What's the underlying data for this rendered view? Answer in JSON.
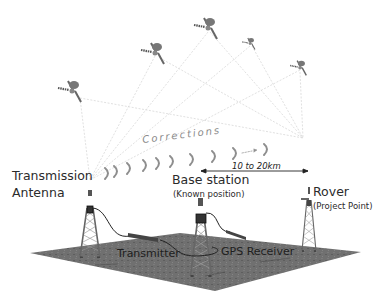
{
  "labels": {
    "transmission_antenna_line1": "Transmission",
    "transmission_antenna_line2": "Antenna",
    "corrections": "Corrections",
    "distance": "10 to 20km",
    "base_station": "Base station",
    "base_station_sub": "(Known position)",
    "rover": "Rover",
    "rover_sub": "(Project  Point)",
    "transmitter": "Transmitter",
    "gps_receiver": "GPS Receiver"
  },
  "colors": {
    "ground": "#6f6f6f",
    "text": "#2b2b2b",
    "signal_lines": "#cfcfcf",
    "corrections_arcs": "#9a9a9a"
  },
  "satellites": [
    {
      "x": 72,
      "y": 90
    },
    {
      "x": 155,
      "y": 52
    },
    {
      "x": 208,
      "y": 27
    },
    {
      "x": 250,
      "y": 43
    },
    {
      "x": 300,
      "y": 67
    }
  ],
  "towers": [
    {
      "name": "transmission-antenna",
      "x": 90
    },
    {
      "name": "base-station",
      "x": 201
    },
    {
      "name": "rover",
      "x": 309
    }
  ]
}
